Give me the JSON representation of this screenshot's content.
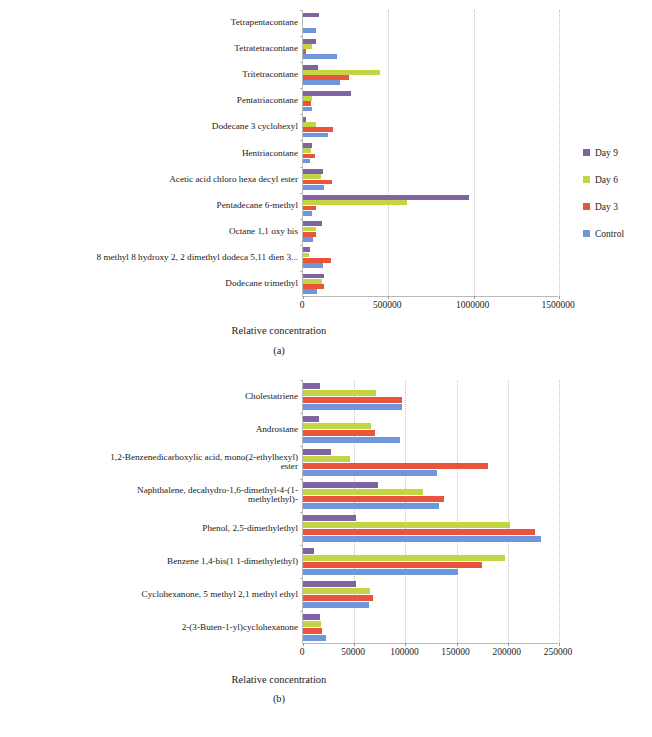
{
  "figure": {
    "panel_a_letter": "(a)",
    "panel_b_letter": "(b)",
    "axis_title": "Relative concentration"
  },
  "legend": {
    "items": [
      {
        "label": "Day 9",
        "color": "#8064A2"
      },
      {
        "label": "Day 6",
        "color": "#C3D545"
      },
      {
        "label": "Day 3",
        "color": "#E8553C"
      },
      {
        "label": "Control",
        "color": "#6E96D8"
      }
    ]
  },
  "chart_data": [
    {
      "type": "bar",
      "orientation": "horizontal",
      "panel": "(a)",
      "title": "",
      "xlabel": "Relative concentration",
      "ylabel": "",
      "xlim": [
        0,
        1500000
      ],
      "xticks": [
        0,
        500000,
        1000000,
        1500000
      ],
      "xticklabels": [
        "0",
        "500000",
        "1000000",
        "1500000"
      ],
      "grid": true,
      "legend_position": "right",
      "categories": [
        "Tetrapentacontane",
        "Tetratetracontane",
        "Tritetracontane",
        "Pentatriacontane",
        "Dodecane 3 cyclohexyl",
        "Hentriacontane",
        "Acetic acid chloro hexa decyl ester",
        "Pentadecane 6-methyl",
        "Octane 1,1 oxy bis",
        "8 methyl 8 hydroxy 2, 2 dimethyl dodeca 5,11 dien 3...",
        "Dodecane trimethyl"
      ],
      "series": [
        {
          "name": "Day 9",
          "color": "#8064A2",
          "values": [
            95000,
            75000,
            85000,
            280000,
            15000,
            50000,
            115000,
            970000,
            110000,
            40000,
            125000
          ]
        },
        {
          "name": "Day 6",
          "color": "#C3D545",
          "values": [
            0,
            55000,
            450000,
            50000,
            75000,
            45000,
            105000,
            610000,
            75000,
            35000,
            110000
          ]
        },
        {
          "name": "Day 3",
          "color": "#E8553C",
          "values": [
            0,
            15000,
            270000,
            45000,
            175000,
            70000,
            170000,
            75000,
            75000,
            165000,
            125000
          ]
        },
        {
          "name": "Control",
          "color": "#6E96D8",
          "values": [
            75000,
            200000,
            215000,
            55000,
            145000,
            40000,
            125000,
            55000,
            60000,
            115000,
            80000
          ]
        }
      ]
    },
    {
      "type": "bar",
      "orientation": "horizontal",
      "panel": "(b)",
      "title": "",
      "xlabel": "Relative concentration",
      "ylabel": "",
      "xlim": [
        0,
        250000
      ],
      "xticks": [
        0,
        50000,
        100000,
        150000,
        200000,
        250000
      ],
      "xticklabels": [
        "0",
        "50000",
        "100000",
        "150000",
        "200000",
        "250000"
      ],
      "grid": true,
      "legend_position": "right",
      "categories": [
        "Cholestatriene",
        "Androstane",
        "1,2-Benzenedicarboxylic acid, mono(2-ethylhexyl)\nester",
        "Naphthalene, decahydro-1,6-dimethyl-4-(1-\nmethylethyl)-",
        "Phenol, 2,5-dimethylethyl",
        "Benzene 1,4-bis(1 1-dimethylethyl)",
        "Cyclohexanone, 5 methyl 2,1 methyl ethyl",
        "2-(3-Buten-1-yl)cyclohexanone"
      ],
      "series": [
        {
          "name": "Day 9",
          "color": "#8064A2",
          "values": [
            17000,
            16000,
            27000,
            73000,
            52000,
            11000,
            52000,
            17000
          ]
        },
        {
          "name": "Day 6",
          "color": "#C3D545",
          "values": [
            71000,
            66000,
            46000,
            117000,
            202000,
            197000,
            65000,
            18000
          ]
        },
        {
          "name": "Day 3",
          "color": "#E8553C",
          "values": [
            97000,
            70000,
            181000,
            138000,
            227000,
            175000,
            68000,
            19000
          ]
        },
        {
          "name": "Control",
          "color": "#6E96D8",
          "values": [
            97000,
            95000,
            131000,
            133000,
            232000,
            151000,
            64000,
            22000
          ]
        }
      ]
    }
  ]
}
